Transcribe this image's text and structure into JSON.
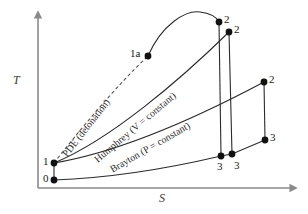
{
  "figure": {
    "type": "thermodynamic-cycle-ts-diagram",
    "background": "#ffffff",
    "axes": {
      "y_label": "T",
      "x_label": "S",
      "line_color": "#8a8a8a",
      "y_axis_x": 38,
      "y_axis_top": 12,
      "x_axis_y": 188,
      "x_axis_right": 297
    },
    "curves": [
      {
        "name": "PDE (detonation)",
        "label": "PDE (detonation)",
        "style": "dashed",
        "color": "#555555",
        "label_rotation": -52,
        "label_x": 60,
        "label_y": 152
      },
      {
        "name": "Humphrey (V = constant)",
        "label": "Humphrey (V = constant)",
        "style": "solid",
        "color": "#2b2b2b",
        "label_rotation": -40,
        "label_x": 92,
        "label_y": 156
      },
      {
        "name": "Brayton (P = constant)",
        "label": "Brayton (P = constant)",
        "style": "solid",
        "color": "#2b2b2b",
        "label_rotation": -30,
        "label_x": 108,
        "label_y": 164
      }
    ],
    "points": [
      {
        "id": "pt-0",
        "label": "0",
        "x": 54,
        "y": 180,
        "label_dx": -11,
        "label_dy": -8
      },
      {
        "id": "pt-1",
        "label": "1",
        "x": 54,
        "y": 163,
        "label_dx": -11,
        "label_dy": -8
      },
      {
        "id": "pt-1a",
        "label": "1a",
        "x": 148,
        "y": 56,
        "label_dx": -18,
        "label_dy": -9
      },
      {
        "id": "pt-2-pde",
        "label": "2",
        "x": 219,
        "y": 22,
        "label_dx": 5,
        "label_dy": -9
      },
      {
        "id": "pt-2-humphrey",
        "label": "2",
        "x": 229,
        "y": 32,
        "label_dx": 5,
        "label_dy": -9
      },
      {
        "id": "pt-2-brayton",
        "label": "2",
        "x": 264,
        "y": 82,
        "label_dx": 5,
        "label_dy": -9
      },
      {
        "id": "pt-3-pde",
        "label": "3",
        "x": 221,
        "y": 156,
        "label_dx": -4,
        "label_dy": 4
      },
      {
        "id": "pt-3-humphrey",
        "label": "3",
        "x": 232,
        "y": 154,
        "label_dx": 2,
        "label_dy": 5
      },
      {
        "id": "pt-3-brayton",
        "label": "3",
        "x": 265,
        "y": 140,
        "label_dx": 5,
        "label_dy": -8
      }
    ],
    "marker_color": "#111111",
    "marker_radius": 3.4
  }
}
